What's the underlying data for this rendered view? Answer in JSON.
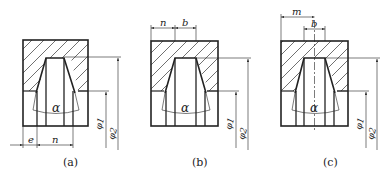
{
  "figures": [
    {
      "id": "a",
      "caption": "(a)",
      "angle_label": "α",
      "dims": {
        "left": "e",
        "right": "n",
        "phi1": "φ1",
        "phi2": "φ2"
      }
    },
    {
      "id": "b",
      "caption": "(b)",
      "angle_label": "α",
      "dims": {
        "left": "n",
        "right": "b",
        "phi1": "φ1",
        "phi2": "φ2"
      }
    },
    {
      "id": "c",
      "caption": "(c)",
      "angle_label": "α",
      "dims": {
        "outer": "m",
        "inner": "b",
        "phi1": "φ1",
        "phi2": "φ2"
      }
    }
  ],
  "colors": {
    "line": "#222222",
    "background": "#ffffff"
  }
}
